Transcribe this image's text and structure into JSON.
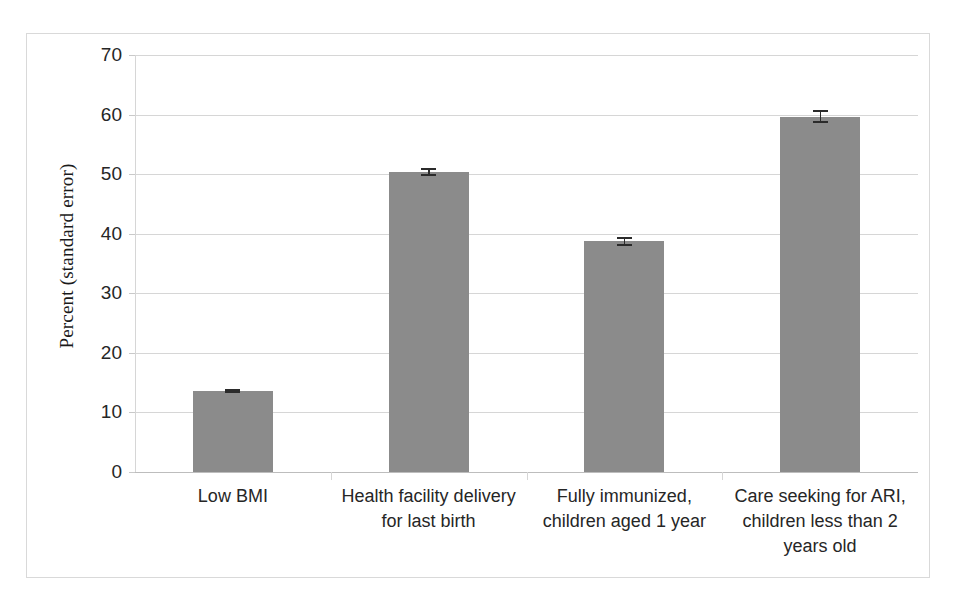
{
  "chart_data": {
    "type": "bar",
    "title": "",
    "subtitle": "",
    "xlabel": "",
    "ylabel": "Percent (standard error)",
    "ylim": [
      0,
      70
    ],
    "ytick_labels": [
      "70",
      "60",
      "50",
      "40",
      "30",
      "20",
      "10",
      "0"
    ],
    "ytick_values": [
      70,
      60,
      50,
      40,
      30,
      20,
      10,
      0
    ],
    "grid": "horizontal",
    "legend": "none",
    "bar_color": "#8b8b8b",
    "errorbar_color": "#2b2b2b",
    "gridline_color": "#d6d6d6",
    "border_color": "#d9d9d9",
    "background": "#ffffff",
    "categories": [
      "Low BMI",
      "Health facility delivery for last birth",
      "Fully immunized, children aged 1 year",
      "Care seeking for ARI, children less than 2 years old"
    ],
    "category_lines": [
      [
        "Low BMI"
      ],
      [
        "Health facility delivery",
        "for last birth"
      ],
      [
        "Fully immunized,",
        "children aged 1 year"
      ],
      [
        "Care seeking for ARI,",
        "children less than 2",
        "years old"
      ]
    ],
    "values": [
      13.6,
      50.4,
      38.7,
      59.6
    ],
    "errors": [
      0.4,
      0.7,
      0.8,
      1.1
    ],
    "series": [
      {
        "name": "Percent",
        "values": [
          13.6,
          50.4,
          38.7,
          59.6
        ],
        "errors": [
          0.4,
          0.7,
          0.8,
          1.1
        ]
      }
    ]
  }
}
